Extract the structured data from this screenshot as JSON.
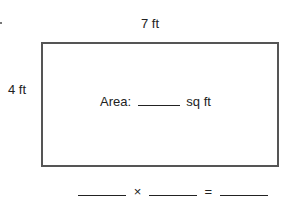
{
  "diagram": {
    "width_label": "7 ft",
    "height_label": "4 ft",
    "area_prefix": "Area:",
    "area_unit": "sq ft",
    "equation": {
      "times_symbol": "×",
      "equals_symbol": "="
    }
  }
}
